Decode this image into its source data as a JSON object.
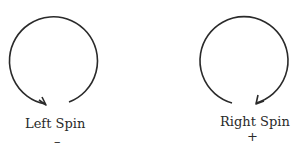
{
  "diagram": {
    "left": {
      "label": "Left Spin",
      "sign": "–",
      "direction": "counterclockwise-arrow"
    },
    "right": {
      "label": "Right Spin",
      "sign": "+",
      "direction": "clockwise-arrow"
    },
    "stroke_color": "#2a2a2a"
  }
}
